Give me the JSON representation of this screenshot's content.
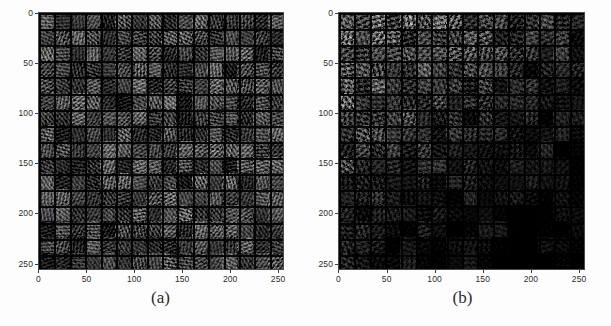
{
  "figure": {
    "background_color": "#fdfdfd",
    "panel_count": 2
  },
  "panels": [
    {
      "id": "panel-a",
      "caption": "(a)",
      "xticks": [
        "0",
        "50",
        "100",
        "150",
        "200",
        "250"
      ],
      "yticks": [
        "0",
        "50",
        "100",
        "150",
        "200",
        "250"
      ],
      "tick_color": "#2b2b2b"
    },
    {
      "id": "panel-b",
      "caption": "(b)",
      "xticks": [
        "0",
        "50",
        "100",
        "150",
        "200",
        "250"
      ],
      "yticks": [
        "0",
        "50",
        "100",
        "150",
        "200",
        "250"
      ],
      "tick_color": "#2b2b2b"
    }
  ],
  "chart_data": {
    "type": "heatmap",
    "title": "",
    "subtitle": "",
    "xlabel": "",
    "ylabel": "",
    "grid": false,
    "legend_position": "none",
    "panels": [
      {
        "label": "(a)",
        "description": "16 by 16 montage of generated grayscale image samples, uniformly bright",
        "xlim": [
          0,
          256
        ],
        "ylim": [
          256,
          0
        ],
        "xticks": [
          0,
          50,
          100,
          150,
          200,
          250
        ],
        "yticks": [
          0,
          50,
          100,
          150,
          200,
          250
        ],
        "grid_rows": 16,
        "grid_cols": 16,
        "tile_size_px": 16,
        "mean_brightness": 0.55,
        "brightness_gradient": "none"
      },
      {
        "label": "(b)",
        "description": "16 by 16 montage of generated grayscale image samples with brightness falling off toward bottom-right",
        "xlim": [
          0,
          256
        ],
        "ylim": [
          256,
          0
        ],
        "xticks": [
          0,
          50,
          100,
          150,
          200,
          250
        ],
        "yticks": [
          0,
          50,
          100,
          150,
          200,
          250
        ],
        "grid_rows": 16,
        "grid_cols": 16,
        "tile_size_px": 16,
        "mean_brightness": 0.33,
        "brightness_gradient": "top-left bright to bottom-right dark"
      }
    ]
  }
}
